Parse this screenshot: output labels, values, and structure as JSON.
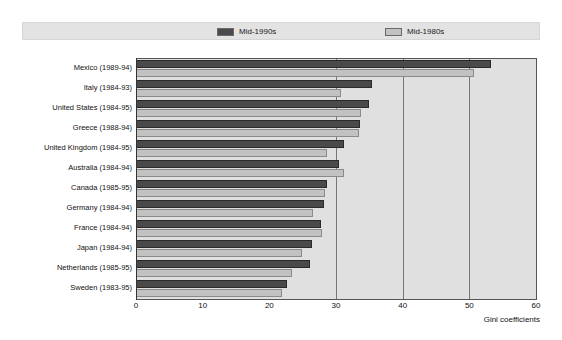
{
  "legend": {
    "entries": [
      {
        "label": "Mid-1990s",
        "color": "#4a4a4a"
      },
      {
        "label": "Mid-1980s",
        "color": "#c2c2c2"
      }
    ]
  },
  "axis": {
    "title": "Gini coefficients",
    "ticks": [
      "0",
      "10",
      "20",
      "30",
      "40",
      "50",
      "60"
    ]
  },
  "chart_data": {
    "type": "bar",
    "orientation": "horizontal",
    "title": "",
    "subtitle": "",
    "xlabel": "Gini coefficients",
    "ylabel": "",
    "xlim": [
      0,
      60
    ],
    "xticks": [
      0,
      10,
      20,
      30,
      40,
      50,
      60
    ],
    "grid": true,
    "gridlines_x": [
      30,
      40,
      50
    ],
    "legend_position": "top",
    "categories": [
      "Mexico (1989-94)",
      "Italy (1984-93)",
      "United States (1984-95)",
      "Greece (1988-94)",
      "United Kingdom (1984-95)",
      "Australia (1984-94)",
      "Canada (1985-95)",
      "Germany (1984-94)",
      "France (1984-94)",
      "Japan (1984-94)",
      "Netherlands (1985-95)",
      "Sweden (1983-95)"
    ],
    "series": [
      {
        "name": "Mid-1990s",
        "color": "#4a4a4a",
        "values": [
          53.3,
          35.4,
          34.9,
          33.6,
          31.2,
          30.5,
          28.6,
          28.2,
          27.8,
          26.4,
          26.1,
          22.7
        ]
      },
      {
        "name": "Mid-1980s",
        "color": "#c2c2c2",
        "values": [
          50.7,
          30.8,
          33.8,
          33.5,
          28.6,
          31.2,
          28.3,
          26.5,
          27.9,
          24.9,
          23.4,
          21.9
        ]
      }
    ]
  }
}
